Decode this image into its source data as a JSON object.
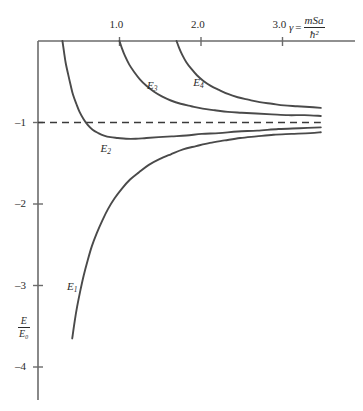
{
  "chart_data": {
    "type": "line",
    "title": "",
    "subtitle": "",
    "xlabel": "γ = mSa/ħ²",
    "ylabel": "E/E₀",
    "xlim": [
      0,
      3.5
    ],
    "ylim": [
      -4.3,
      0
    ],
    "grid": false,
    "legend_position": "inline-curve-labels",
    "x_ticks": [
      {
        "value": 1.0,
        "label": "1.0"
      },
      {
        "value": 2.0,
        "label": "2.0"
      },
      {
        "value": 3.0,
        "label": "3.0"
      }
    ],
    "y_ticks": [
      {
        "value": -1,
        "label": "–1"
      },
      {
        "value": -2,
        "label": "–2"
      },
      {
        "value": -3,
        "label": "–3"
      },
      {
        "value": -4,
        "label": "–4"
      }
    ],
    "annotations": [
      {
        "name": "asymptote",
        "type": "dashed-horizontal-line",
        "y": -1,
        "x_start": 0.0,
        "x_end": 3.47
      }
    ],
    "series": [
      {
        "name": "E1",
        "label": "E₁",
        "label_position": {
          "x": 0.43,
          "y": -3.02
        },
        "points": [
          [
            0.42,
            -3.65
          ],
          [
            0.45,
            -3.44
          ],
          [
            0.48,
            -3.26
          ],
          [
            0.52,
            -3.06
          ],
          [
            0.56,
            -2.88
          ],
          [
            0.61,
            -2.69
          ],
          [
            0.66,
            -2.52
          ],
          [
            0.72,
            -2.36
          ],
          [
            0.79,
            -2.2
          ],
          [
            0.86,
            -2.06
          ],
          [
            0.94,
            -1.93
          ],
          [
            1.03,
            -1.81
          ],
          [
            1.13,
            -1.7
          ],
          [
            1.24,
            -1.61
          ],
          [
            1.36,
            -1.52
          ],
          [
            1.49,
            -1.45
          ],
          [
            1.63,
            -1.39
          ],
          [
            1.78,
            -1.33
          ],
          [
            1.94,
            -1.29
          ],
          [
            2.11,
            -1.25
          ],
          [
            2.29,
            -1.22
          ],
          [
            2.48,
            -1.19
          ],
          [
            2.68,
            -1.17
          ],
          [
            2.89,
            -1.15
          ],
          [
            3.11,
            -1.14
          ],
          [
            3.34,
            -1.13
          ],
          [
            3.47,
            -1.12
          ]
        ]
      },
      {
        "name": "E2",
        "label": "E₂",
        "label_position": {
          "x": 0.84,
          "y": -1.33
        },
        "points": [
          [
            0.3,
            0.0
          ],
          [
            0.32,
            -0.14
          ],
          [
            0.34,
            -0.27
          ],
          [
            0.37,
            -0.41
          ],
          [
            0.4,
            -0.54
          ],
          [
            0.43,
            -0.66
          ],
          [
            0.47,
            -0.77
          ],
          [
            0.51,
            -0.87
          ],
          [
            0.56,
            -0.96
          ],
          [
            0.61,
            -1.03
          ],
          [
            0.67,
            -1.09
          ],
          [
            0.74,
            -1.13
          ],
          [
            0.81,
            -1.16
          ],
          [
            0.89,
            -1.18
          ],
          [
            0.98,
            -1.19
          ],
          [
            1.08,
            -1.2
          ],
          [
            1.2,
            -1.2
          ],
          [
            1.33,
            -1.19
          ],
          [
            1.48,
            -1.18
          ],
          [
            1.64,
            -1.17
          ],
          [
            1.82,
            -1.16
          ],
          [
            2.01,
            -1.14
          ],
          [
            2.22,
            -1.13
          ],
          [
            2.45,
            -1.11
          ],
          [
            2.69,
            -1.1
          ],
          [
            2.95,
            -1.08
          ],
          [
            3.21,
            -1.07
          ],
          [
            3.47,
            -1.06
          ]
        ]
      },
      {
        "name": "E3",
        "label": "E₃",
        "label_position": {
          "x": 1.41,
          "y": -0.55
        },
        "points": [
          [
            1.0,
            0.0
          ],
          [
            1.03,
            -0.09
          ],
          [
            1.07,
            -0.19
          ],
          [
            1.12,
            -0.29
          ],
          [
            1.18,
            -0.38
          ],
          [
            1.25,
            -0.47
          ],
          [
            1.33,
            -0.55
          ],
          [
            1.42,
            -0.62
          ],
          [
            1.52,
            -0.68
          ],
          [
            1.63,
            -0.73
          ],
          [
            1.75,
            -0.77
          ],
          [
            1.88,
            -0.8
          ],
          [
            2.02,
            -0.83
          ],
          [
            2.17,
            -0.85
          ],
          [
            2.33,
            -0.87
          ],
          [
            2.5,
            -0.88
          ],
          [
            2.68,
            -0.89
          ],
          [
            2.87,
            -0.9
          ],
          [
            3.07,
            -0.91
          ],
          [
            3.27,
            -0.91
          ],
          [
            3.47,
            -0.92
          ]
        ]
      },
      {
        "name": "E4",
        "label": "E₄",
        "label_position": {
          "x": 1.98,
          "y": -0.52
        },
        "points": [
          [
            1.7,
            0.0
          ],
          [
            1.73,
            -0.08
          ],
          [
            1.77,
            -0.17
          ],
          [
            1.82,
            -0.26
          ],
          [
            1.88,
            -0.34
          ],
          [
            1.95,
            -0.42
          ],
          [
            2.03,
            -0.49
          ],
          [
            2.12,
            -0.55
          ],
          [
            2.22,
            -0.6
          ],
          [
            2.33,
            -0.65
          ],
          [
            2.45,
            -0.69
          ],
          [
            2.58,
            -0.72
          ],
          [
            2.72,
            -0.75
          ],
          [
            2.87,
            -0.77
          ],
          [
            3.02,
            -0.79
          ],
          [
            3.18,
            -0.8
          ],
          [
            3.33,
            -0.81
          ],
          [
            3.47,
            -0.82
          ]
        ]
      }
    ],
    "axis_title_parts": {
      "gamma_symbol": "γ",
      "equals": "=",
      "numerator": "mSa",
      "denominator": "ħ²"
    },
    "y_axis_title_parts": {
      "numerator": "E",
      "denominator": "E₀"
    },
    "colors": {
      "axis": "#6b6b6b",
      "curve": "#4a4a4a",
      "text": "#2b2b2b",
      "dashed": "#3a3a3a"
    }
  }
}
